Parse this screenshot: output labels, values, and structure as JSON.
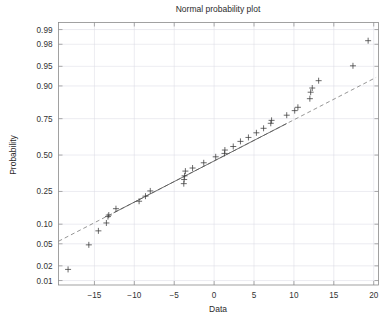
{
  "chart_data": {
    "type": "scatter",
    "title": "Normal probability plot",
    "xlabel": "Data",
    "ylabel": "Probability",
    "xlim": [
      -19.5,
      20.6
    ],
    "ylim": [
      0.008,
      0.993
    ],
    "grid": true,
    "legend": "none",
    "y_scale": "normal-probability",
    "x_ticks": [
      -15,
      -10,
      -5,
      0,
      5,
      10,
      15,
      20
    ],
    "x_tick_labels": [
      "−15",
      "−10",
      "−5",
      "0",
      "5",
      "10",
      "15",
      "20"
    ],
    "y_ticks": [
      0.01,
      0.02,
      0.05,
      0.1,
      0.25,
      0.5,
      0.75,
      0.9,
      0.95,
      0.98,
      0.99
    ],
    "y_tick_labels": [
      "0.01",
      "0.02",
      "0.05",
      "0.10",
      "0.25",
      "0.50",
      "0.75",
      "0.90",
      "0.95",
      "0.98",
      "0.99"
    ],
    "marker_symbol": "plus",
    "marker_color": "#3a3a3a",
    "reference_line": {
      "style": "dashed",
      "color": "#7b7b7b",
      "x1": -19.5,
      "p1": 0.055,
      "x2": 20.3,
      "p2": 0.925,
      "inner_solid_from_x": -12.6,
      "inner_solid_to_x": 9.1
    },
    "points": [
      {
        "x": -18.3,
        "p": 0.017
      },
      {
        "x": -15.7,
        "p": 0.048
      },
      {
        "x": -14.5,
        "p": 0.08
      },
      {
        "x": -13.5,
        "p": 0.104
      },
      {
        "x": -13.3,
        "p": 0.127
      },
      {
        "x": -13.2,
        "p": 0.133
      },
      {
        "x": -12.3,
        "p": 0.16
      },
      {
        "x": -9.4,
        "p": 0.196
      },
      {
        "x": -8.6,
        "p": 0.223
      },
      {
        "x": -8.0,
        "p": 0.253
      },
      {
        "x": -3.8,
        "p": 0.298
      },
      {
        "x": -3.75,
        "p": 0.325
      },
      {
        "x": -3.7,
        "p": 0.35
      },
      {
        "x": -3.6,
        "p": 0.383
      },
      {
        "x": -2.7,
        "p": 0.405
      },
      {
        "x": -1.3,
        "p": 0.443
      },
      {
        "x": 0.2,
        "p": 0.487
      },
      {
        "x": 1.3,
        "p": 0.512
      },
      {
        "x": 1.35,
        "p": 0.537
      },
      {
        "x": 2.4,
        "p": 0.563
      },
      {
        "x": 3.3,
        "p": 0.6
      },
      {
        "x": 4.3,
        "p": 0.628
      },
      {
        "x": 5.3,
        "p": 0.66
      },
      {
        "x": 6.2,
        "p": 0.69
      },
      {
        "x": 7.1,
        "p": 0.722
      },
      {
        "x": 7.2,
        "p": 0.74
      },
      {
        "x": 9.1,
        "p": 0.77
      },
      {
        "x": 10.1,
        "p": 0.795
      },
      {
        "x": 10.5,
        "p": 0.812
      },
      {
        "x": 12.0,
        "p": 0.852
      },
      {
        "x": 12.1,
        "p": 0.878
      },
      {
        "x": 12.3,
        "p": 0.893
      },
      {
        "x": 13.1,
        "p": 0.916
      },
      {
        "x": 17.4,
        "p": 0.951
      },
      {
        "x": 19.3,
        "p": 0.983
      }
    ]
  }
}
